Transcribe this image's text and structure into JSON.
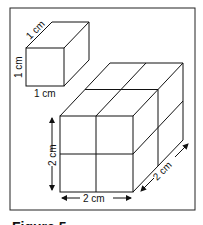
{
  "figure": {
    "caption": "Figure 5",
    "small_cube": {
      "depth_label": "1 cm",
      "height_label": "1 cm",
      "width_label": "1 cm"
    },
    "large_cube": {
      "height_label": "2 cm",
      "width_label": "2 cm",
      "depth_label": "2 cm",
      "grid": "2x2x2"
    }
  }
}
